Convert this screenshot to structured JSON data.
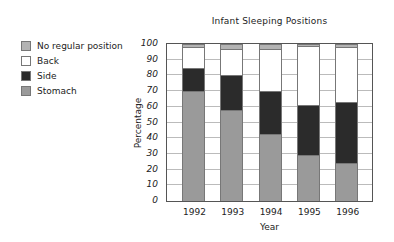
{
  "chart_data": {
    "type": "bar",
    "stacked": true,
    "title": "Infant Sleeping Positions",
    "xlabel": "Year",
    "ylabel": "Percentage",
    "ylim": [
      0,
      100
    ],
    "yticks": [
      0,
      10,
      20,
      30,
      40,
      50,
      60,
      70,
      80,
      90,
      100
    ],
    "grid": true,
    "legend_position": "left",
    "categories": [
      "1992",
      "1993",
      "1994",
      "1995",
      "1996"
    ],
    "series": [
      {
        "name": "Stomach",
        "color": "#9a9a9a",
        "values": [
          70,
          58,
          43,
          29,
          24
        ]
      },
      {
        "name": "Side",
        "color": "#2b2b2b",
        "values": [
          15,
          22,
          27,
          32,
          39
        ]
      },
      {
        "name": "Back",
        "color": "#ffffff",
        "values": [
          13,
          17,
          27,
          38,
          35
        ]
      },
      {
        "name": "No regular position",
        "color": "#b3b3b3",
        "values": [
          2,
          3,
          3,
          1,
          2
        ]
      }
    ]
  },
  "legend": {
    "items": [
      {
        "label": "No regular position",
        "color": "#b3b3b3"
      },
      {
        "label": "Back",
        "color": "#ffffff"
      },
      {
        "label": "Side",
        "color": "#2b2b2b"
      },
      {
        "label": "Stomach",
        "color": "#9a9a9a"
      }
    ]
  }
}
